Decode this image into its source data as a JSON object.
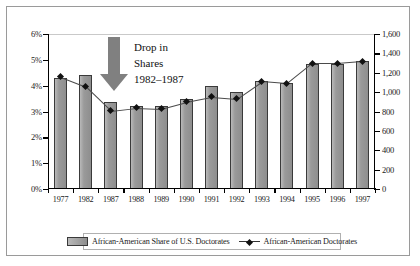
{
  "chart_data": {
    "type": "bar",
    "title": "",
    "xlabel": "",
    "ylabel": "",
    "categories": [
      "1977",
      "1982",
      "1987",
      "1988",
      "1989",
      "1990",
      "1991",
      "1992",
      "1993",
      "1994",
      "1995",
      "1996",
      "1997"
    ],
    "series": [
      {
        "name": "African-American Share of U.S. Doctorates",
        "type": "bar",
        "axis": "left",
        "unit": "percent",
        "values": [
          4.3,
          4.4,
          3.35,
          3.2,
          3.2,
          3.5,
          4.0,
          3.75,
          4.2,
          4.1,
          4.85,
          4.85,
          4.95
        ]
      },
      {
        "name": "African-American Doctorates",
        "type": "line",
        "axis": "right",
        "unit": "count",
        "values": [
          1160,
          1060,
          810,
          840,
          830,
          900,
          950,
          930,
          1110,
          1090,
          1300,
          1300,
          1320
        ]
      }
    ],
    "left_axis": {
      "ylim": [
        0,
        6
      ],
      "ticks": [
        0,
        1,
        2,
        3,
        4,
        5,
        6
      ],
      "tick_labels": [
        "0%",
        "1%",
        "2%",
        "3%",
        "4%",
        "5%",
        "6%"
      ]
    },
    "right_axis": {
      "ylim": [
        0,
        1600
      ],
      "ticks": [
        0,
        200,
        400,
        600,
        800,
        1000,
        1200,
        1400,
        1600
      ],
      "tick_labels": [
        "0",
        "200",
        "400",
        "600",
        "800",
        "1,000",
        "1,200",
        "1,400",
        "1,600"
      ]
    },
    "grid": false,
    "legend_position": "bottom",
    "annotations": [
      {
        "text_lines": [
          "Drop in",
          "Shares",
          "1982–1987"
        ],
        "marker": "down-arrow"
      }
    ]
  },
  "legend": {
    "items": [
      {
        "label": "African-American Share of U.S. Doctorates",
        "marker": "bar-swatch"
      },
      {
        "label": "African-American Doctorates",
        "marker": "line-diamond"
      }
    ]
  },
  "annotation": {
    "line1": "Drop in",
    "line2": "Shares",
    "line3": "1982–1987"
  },
  "colors": {
    "bar_fill": "#9c9c9c",
    "bar_stroke": "#3a3a3a",
    "line": "#4a4a4a",
    "marker": "#111111",
    "arrow": "#808080",
    "frame": "#9a9a9a"
  }
}
